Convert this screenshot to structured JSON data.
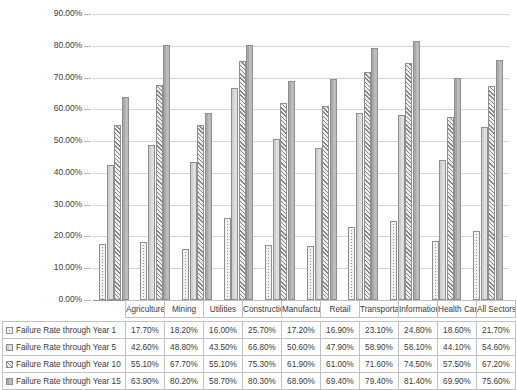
{
  "chart_data": {
    "type": "bar",
    "title": "",
    "xlabel": "",
    "ylabel": "",
    "ylim": [
      0,
      90
    ],
    "ytick_labels": [
      "90.00%",
      "80.00%",
      "70.00%",
      "60.00%",
      "50.00%",
      "40.00%",
      "30.00%",
      "20.00%",
      "10.00%",
      "0.00%"
    ],
    "ytick_values": [
      90,
      80,
      70,
      60,
      50,
      40,
      30,
      20,
      10,
      0
    ],
    "grid": true,
    "legend_position": "data-table",
    "categories": [
      "Agriculture",
      "Mining",
      "Utilities",
      "Construction",
      "Manufacturing",
      "Retail",
      "Transportation",
      "Information",
      "Health Care",
      "All Sectors"
    ],
    "series": [
      {
        "name": "Failure Rate through Year 1",
        "pattern": "dotted",
        "values": [
          17.7,
          18.2,
          16.0,
          25.7,
          17.2,
          16.9,
          23.1,
          24.8,
          18.6,
          21.7
        ],
        "labels": [
          "17.70%",
          "18.20%",
          "16.00%",
          "25.70%",
          "17.20%",
          "16.90%",
          "23.10%",
          "24.80%",
          "18.60%",
          "21.70%"
        ]
      },
      {
        "name": "Failure Rate through Year 5",
        "pattern": "solid-light",
        "values": [
          42.6,
          48.8,
          43.5,
          66.8,
          50.6,
          47.9,
          58.9,
          58.1,
          44.1,
          54.6
        ],
        "labels": [
          "42.60%",
          "48.80%",
          "43.50%",
          "66.80%",
          "50.60%",
          "47.90%",
          "58.90%",
          "58.10%",
          "44.10%",
          "54.60%"
        ]
      },
      {
        "name": "Failure Rate through Year 10",
        "pattern": "diagonal-hatch",
        "values": [
          55.1,
          67.7,
          55.1,
          75.3,
          61.9,
          61.0,
          71.6,
          74.5,
          57.5,
          67.2
        ],
        "labels": [
          "55.10%",
          "67.70%",
          "55.10%",
          "75.30%",
          "61.90%",
          "61.00%",
          "71.60%",
          "74.50%",
          "57.50%",
          "67.20%"
        ]
      },
      {
        "name": "Failure Rate through Year 15",
        "pattern": "solid-gray",
        "values": [
          63.9,
          80.2,
          58.7,
          80.3,
          68.9,
          69.4,
          79.4,
          81.4,
          69.9,
          75.6
        ],
        "labels": [
          "63.90%",
          "80.20%",
          "58.70%",
          "80.30%",
          "68.90%",
          "69.40%",
          "79.40%",
          "81.40%",
          "69.90%",
          "75.60%"
        ]
      }
    ]
  },
  "colors": {
    "gridline": "#d4d4d4",
    "axis": "#9a9a9a",
    "series1": "#f2f2f2",
    "series2": "#d9d9d9",
    "series3": "#eeeeee",
    "series4": "#b5b5b5",
    "text": "#3a3a3a",
    "table_border": "#c2c2c2"
  }
}
